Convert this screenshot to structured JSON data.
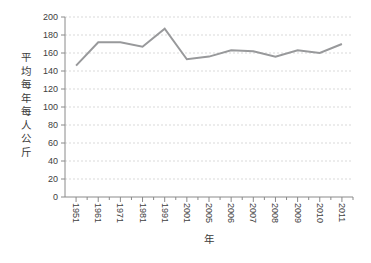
{
  "chart_data": {
    "type": "line",
    "title": "",
    "categories": [
      "1951",
      "1961",
      "1971",
      "1981",
      "1991",
      "2001",
      "2005",
      "2006",
      "2007",
      "2008",
      "2009",
      "2010",
      "2011"
    ],
    "values": [
      146,
      172,
      172,
      167,
      187,
      153,
      156,
      163,
      162,
      156,
      163,
      160,
      170
    ],
    "xlabel": "年",
    "ylabel": "平均每年每人公斤",
    "ylim": [
      0,
      200
    ],
    "ytick_step": 20,
    "yticks": [
      0,
      20,
      40,
      60,
      80,
      100,
      120,
      140,
      160,
      180,
      200
    ],
    "grid": "horizontal-dotted",
    "legend": "none",
    "colors": {
      "line": "#98999b",
      "axis": "#8a8a8a",
      "grid": "#d9d9d9",
      "tick_label": "#404040",
      "background": "#ffffff"
    }
  }
}
